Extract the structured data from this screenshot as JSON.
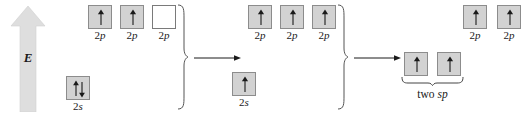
{
  "diagram": {
    "background_color": "#ffffff",
    "box_fill_color": "#d2d2d2",
    "box_empty_color": "#ffffff",
    "box_border_color": "#8c8c8c",
    "arrow_color": "#1a1a1a",
    "energy_axis_color": "#dcdcdc",
    "width": 530,
    "height": 115
  },
  "energy_axis": {
    "label": "E",
    "direction": "up",
    "name": "energy-axis"
  },
  "transition_arrows": [
    {
      "label": "",
      "from_stage": 1,
      "to_stage": 2
    },
    {
      "label": "",
      "from_stage": 2,
      "to_stage": 3
    }
  ],
  "stages": [
    {
      "name": "ground-state",
      "p_orbitals": [
        {
          "label_prefix": "2",
          "label_suffix": "p",
          "electrons": "up",
          "filled": true
        },
        {
          "label_prefix": "2",
          "label_suffix": "p",
          "electrons": "up",
          "filled": true
        },
        {
          "label_prefix": "2",
          "label_suffix": "p",
          "electrons": "none",
          "filled": false
        }
      ],
      "s_orbitals": [
        {
          "label_prefix": "2",
          "label_suffix": "s",
          "electrons": "up-down",
          "filled": true
        }
      ]
    },
    {
      "name": "promoted-state",
      "p_orbitals": [
        {
          "label_prefix": "2",
          "label_suffix": "p",
          "electrons": "up",
          "filled": true
        },
        {
          "label_prefix": "2",
          "label_suffix": "p",
          "electrons": "up",
          "filled": true
        },
        {
          "label_prefix": "2",
          "label_suffix": "p",
          "electrons": "up",
          "filled": true
        }
      ],
      "s_orbitals": [
        {
          "label_prefix": "2",
          "label_suffix": "s",
          "electrons": "up",
          "filled": true
        }
      ]
    },
    {
      "name": "hybridized-state",
      "p_orbitals": [
        {
          "label_prefix": "2",
          "label_suffix": "p",
          "electrons": "up",
          "filled": true
        },
        {
          "label_prefix": "2",
          "label_suffix": "p",
          "electrons": "up",
          "filled": true
        }
      ],
      "hybrid_orbitals": [
        {
          "electrons": "up",
          "filled": true
        },
        {
          "electrons": "up",
          "filled": true
        }
      ],
      "hybrid_label_prefix": "two ",
      "hybrid_label_suffix": "sp"
    }
  ]
}
